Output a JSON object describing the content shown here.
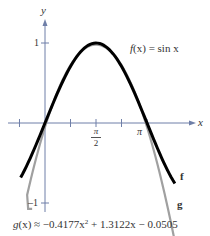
{
  "chart_data": {
    "type": "line",
    "title": "",
    "xlabel": "x",
    "ylabel": "y",
    "x_ticks": [
      {
        "value": -0.7854,
        "label": ""
      },
      {
        "value": 0.7854,
        "label": ""
      },
      {
        "value": 1.5708,
        "label": "π/2"
      },
      {
        "value": 2.3562,
        "label": ""
      },
      {
        "value": 3.1416,
        "label": "π"
      }
    ],
    "y_ticks": [
      {
        "value": 1,
        "label": "1"
      },
      {
        "value": -1,
        "label": "−1"
      }
    ],
    "xlim": [
      -0.9,
      4.6
    ],
    "ylim": [
      -1.15,
      1.25
    ],
    "grid": false,
    "series": [
      {
        "name": "f",
        "label": "f(x) = sin x",
        "color": "#000000",
        "x": [
          -0.75,
          -0.5,
          -0.25,
          0,
          0.25,
          0.5,
          0.75,
          1.0,
          1.25,
          1.5708,
          1.75,
          2.0,
          2.25,
          2.5,
          2.75,
          3.0,
          3.1416,
          3.25,
          3.5,
          3.75,
          4.0
        ],
        "values": [
          -0.682,
          -0.479,
          -0.247,
          0,
          0.247,
          0.479,
          0.682,
          0.841,
          0.949,
          1.0,
          0.984,
          0.909,
          0.778,
          0.598,
          0.382,
          0.141,
          0,
          -0.108,
          -0.351,
          -0.572,
          -0.757
        ]
      },
      {
        "name": "g",
        "label": "g(x) ≈ −0.4177x² + 1.3122x − 0.0505",
        "color": "#a0a0a0",
        "x": [
          -0.55,
          -0.5,
          -0.25,
          0,
          0.25,
          0.5,
          0.75,
          1.0,
          1.25,
          1.5708,
          1.75,
          2.0,
          2.25,
          2.5,
          2.75,
          3.0,
          3.1416,
          3.25,
          3.5,
          3.75,
          3.97
        ],
        "values": [
          -0.899,
          -0.811,
          -0.405,
          -0.051,
          0.252,
          0.501,
          0.698,
          0.844,
          0.937,
          0.981,
          0.967,
          0.903,
          0.787,
          0.62,
          0.402,
          0.132,
          -0.0,
          -0.147,
          -0.581,
          -0.923,
          -1.13
        ]
      }
    ],
    "annotations": [
      {
        "text": "f(x) = sin x",
        "x": 2.6,
        "y": 0.95
      },
      {
        "text": "f",
        "x": 4.2,
        "y": -0.73
      },
      {
        "text": "g",
        "x": 4.15,
        "y": -1.02
      },
      {
        "text": "g(x) ≈ −0.4177x² + 1.3122x − 0.0505",
        "position": "below plot"
      }
    ],
    "legend": "none"
  },
  "labels": {
    "y_axis": "y",
    "x_axis": "x",
    "y_tick_pos": "1",
    "y_tick_neg": "1",
    "x_tick_pi_half_num": "π",
    "x_tick_pi_half_den": "2",
    "x_tick_pi": "π",
    "f_eq_name": "f",
    "f_eq_rest": "(x)  =  sin x",
    "f_end": "f",
    "g_end": "g",
    "g_eq_name": "g",
    "g_eq_rest": "(x)  ≈  −0.4177x",
    "g_eq_exp": "2",
    "g_eq_tail": "  +  1.3122x  −  0.0505"
  },
  "colors": {
    "axis": "#6f7fa8",
    "f": "#000000",
    "g": "#a0a0a0",
    "text": "#333333"
  }
}
